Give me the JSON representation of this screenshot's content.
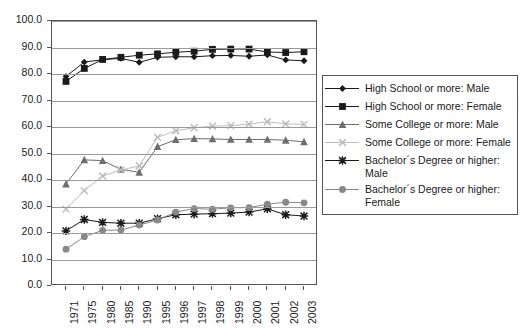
{
  "chart_data": {
    "type": "line",
    "title": "",
    "subtitle": "",
    "xlabel": "",
    "ylabel": "",
    "xlim_categories": true,
    "ylim": [
      0.0,
      100.0
    ],
    "ytick_step": 10.0,
    "ytick_labels": [
      "0.0",
      "10.0",
      "20.0",
      "30.0",
      "40.0",
      "50.0",
      "60.0",
      "70.0",
      "80.0",
      "90.0",
      "100.0"
    ],
    "grid": "horizontal",
    "legend_position": "right",
    "categories": [
      "1971",
      "1975",
      "1980",
      "1985",
      "1990",
      "1995",
      "1996",
      "1997",
      "1998",
      "1999",
      "2000",
      "2001",
      "2002",
      "2003"
    ],
    "series": [
      {
        "name": "High School or more: Male",
        "marker": "diamond",
        "color": "#1a1a1a",
        "line_color": "#1a1a1a",
        "values": [
          79.1,
          84.5,
          85.4,
          85.9,
          84.4,
          86.3,
          86.5,
          86.5,
          86.9,
          87.0,
          86.7,
          87.2,
          85.3,
          85.0
        ]
      },
      {
        "name": "High School or more: Female",
        "marker": "square",
        "color": "#1a1a1a",
        "line_color": "#1a1a1a",
        "values": [
          77.2,
          82.1,
          85.5,
          86.3,
          87.1,
          87.6,
          88.2,
          88.6,
          89.3,
          89.4,
          89.4,
          88.3,
          88.1,
          88.4
        ]
      },
      {
        "name": "Some College or more: Male",
        "marker": "triangle",
        "color": "#6e6e6e",
        "line_color": "#6e6e6e",
        "values": [
          38.5,
          47.6,
          47.3,
          44.0,
          42.9,
          52.6,
          55.2,
          55.6,
          55.5,
          55.3,
          55.3,
          55.3,
          55.0,
          54.4
        ]
      },
      {
        "name": "Some College or more: Female",
        "marker": "cross",
        "color": "#bdbdbd",
        "line_color": "#bdbdbd",
        "values": [
          29.0,
          36.0,
          41.5,
          43.8,
          45.3,
          56.1,
          58.6,
          59.7,
          60.3,
          60.5,
          61.1,
          62.0,
          61.2,
          61.0
        ]
      },
      {
        "name": "Bachelor's Degree or higher: Male",
        "marker": "star",
        "color": "#1a1a1a",
        "line_color": "#1a1a1a",
        "values": [
          20.8,
          25.1,
          24.0,
          23.7,
          23.7,
          25.4,
          26.9,
          27.1,
          27.3,
          27.5,
          27.9,
          29.1,
          26.9,
          26.4
        ]
      },
      {
        "name": "Bachelor's Degree or higher: Female",
        "marker": "circle",
        "color": "#888888",
        "line_color": "#888888",
        "values": [
          13.9,
          18.6,
          21.0,
          21.1,
          23.0,
          24.9,
          27.9,
          29.2,
          29.0,
          29.5,
          29.6,
          30.9,
          31.6,
          31.4
        ]
      }
    ]
  },
  "legend": {
    "entries": [
      "High School or more: Male",
      "High School or more: Female",
      "Some College or more: Male",
      "Some College or more: Female",
      "Bachelor´s Degree or higher:\nMale",
      "Bachelor´s Degree or higher:\nFemale"
    ]
  },
  "colors": {
    "axis": "#555555",
    "grid": "#9a9a9a",
    "text": "#1a1a1a",
    "background": "#ffffff",
    "black_series": "#1a1a1a",
    "mid_gray_series": "#6e6e6e",
    "light_gray_series": "#bdbdbd",
    "gray_series": "#888888"
  }
}
